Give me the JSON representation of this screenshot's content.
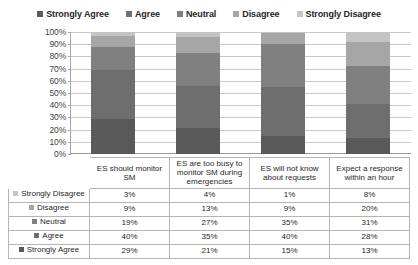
{
  "chart_data": {
    "type": "bar",
    "title": "",
    "xlabel": "",
    "ylabel": "",
    "ylim": [
      0,
      100
    ],
    "grid": true,
    "legend_position": "top",
    "stacked": true,
    "orientation": "vertical",
    "categories": [
      "ES should monitor SM",
      "ES are too busy to monitor SM during emergencies",
      "ES will not know about requests",
      "Expect a response within an hour"
    ],
    "series": [
      {
        "name": "Strongly Agree",
        "values": [
          29,
          21,
          15,
          13
        ],
        "color": "#595959"
      },
      {
        "name": "Agree",
        "values": [
          40,
          35,
          40,
          28
        ],
        "color": "#6e6e6e"
      },
      {
        "name": "Neutral",
        "values": [
          19,
          27,
          35,
          31
        ],
        "color": "#808080"
      },
      {
        "name": "Disagree",
        "values": [
          9,
          13,
          9,
          20
        ],
        "color": "#a6a6a6"
      },
      {
        "name": "Strongly Disagree",
        "values": [
          3,
          4,
          1,
          8
        ],
        "color": "#c4c4c4"
      }
    ],
    "ytick_labels": [
      "100%",
      "90%",
      "80%",
      "70%",
      "60%",
      "50%",
      "40%",
      "30%",
      "20%",
      "10%",
      "0%"
    ],
    "ytick_values": [
      100,
      90,
      80,
      70,
      60,
      50,
      40,
      30,
      20,
      10,
      0
    ]
  },
  "legend": {
    "items": [
      {
        "label": "Strongly Agree",
        "color": "#595959"
      },
      {
        "label": "Agree",
        "color": "#6e6e6e"
      },
      {
        "label": "Neutral",
        "color": "#808080"
      },
      {
        "label": "Disagree",
        "color": "#a6a6a6"
      },
      {
        "label": "Strongly Disagree",
        "color": "#c4c4c4"
      }
    ]
  },
  "table": {
    "corner_label": "",
    "column_headers": [
      "ES should monitor SM",
      "ES are too busy to monitor SM during emergencies",
      "ES will not know about requests",
      "Expect a response within an hour"
    ],
    "rows": [
      {
        "label": "Strongly Disagree",
        "color": "#c4c4c4",
        "values": [
          "3%",
          "4%",
          "1%",
          "8%"
        ]
      },
      {
        "label": "Disagree",
        "color": "#a6a6a6",
        "values": [
          "9%",
          "13%",
          "9%",
          "20%"
        ]
      },
      {
        "label": "Neutral",
        "color": "#808080",
        "values": [
          "19%",
          "27%",
          "35%",
          "31%"
        ]
      },
      {
        "label": "Agree",
        "color": "#6e6e6e",
        "values": [
          "40%",
          "35%",
          "40%",
          "28%"
        ]
      },
      {
        "label": "Strongly Agree",
        "color": "#595959",
        "values": [
          "29%",
          "21%",
          "15%",
          "13%"
        ]
      }
    ]
  }
}
